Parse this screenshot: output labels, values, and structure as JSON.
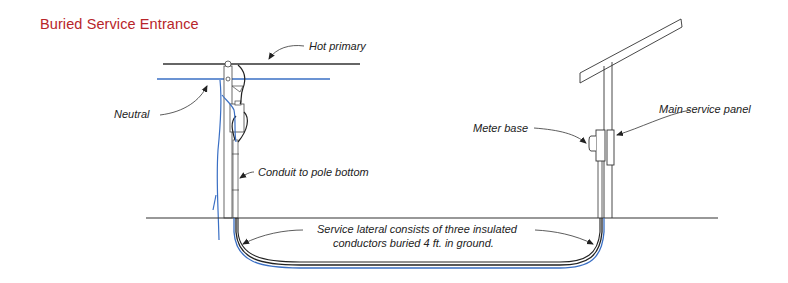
{
  "title": "Buried Service Entrance",
  "labels": {
    "hot_primary": "Hot primary",
    "neutral": "Neutral",
    "conduit": "Conduit to pole bottom",
    "meter_base": "Meter base",
    "main_panel": "Main service panel",
    "lateral_line1": "Service lateral consists of three insulated",
    "lateral_line2": "conductors buried 4 ft. in ground."
  },
  "colors": {
    "title": "#b8252a",
    "neutral_wire": "#3a6fc4",
    "line": "#222222"
  }
}
